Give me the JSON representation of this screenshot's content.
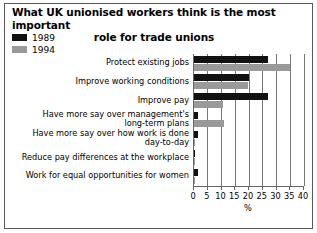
{
  "title": {
    "line1": "What UK unionised workers think is the most important",
    "line2": "role for trade unions"
  },
  "legend": {
    "position": "top-left",
    "entries": [
      {
        "label": "1989",
        "color": "#111111"
      },
      {
        "label": "1994",
        "color": "#999999"
      }
    ]
  },
  "chart_data": {
    "type": "bar",
    "orientation": "horizontal",
    "title": "What UK unionised workers think is the most important role for trade unions",
    "xlabel": "%",
    "ylabel": "",
    "xlim": [
      0,
      40
    ],
    "xticks": [
      0,
      5,
      10,
      15,
      20,
      25,
      30,
      35,
      40
    ],
    "xticklabels": [
      "0",
      "5",
      "10",
      "15",
      "20",
      "25",
      "30",
      "35",
      "40"
    ],
    "grid": true,
    "grid_axis": "x",
    "legend_position": "top-left",
    "categories": [
      "Protect existing jobs",
      "Improve working conditions",
      "Improve pay",
      "Have more say over management's long-term plans",
      "Have more say over how work is done day-to-day",
      "Reduce pay differences at the workplace",
      "Work for equal opportunities for women"
    ],
    "category_lines": [
      [
        "Protect existing jobs"
      ],
      [
        "Improve working conditions"
      ],
      [
        "Improve pay"
      ],
      [
        "Have more say over management's",
        "long-term plans"
      ],
      [
        "Have more say over how work is done",
        "day-to-day"
      ],
      [
        "Reduce pay differences at the workplace"
      ],
      [
        "Work for equal opportunities for women"
      ]
    ],
    "series": [
      {
        "name": "1989",
        "color": "#111111",
        "values": [
          27,
          20,
          27,
          1.5,
          1.5,
          0.4,
          1.5
        ]
      },
      {
        "name": "1994",
        "color": "#999999",
        "values": [
          35,
          19.5,
          10.5,
          11,
          0.3,
          0.3,
          0.3
        ]
      }
    ]
  }
}
